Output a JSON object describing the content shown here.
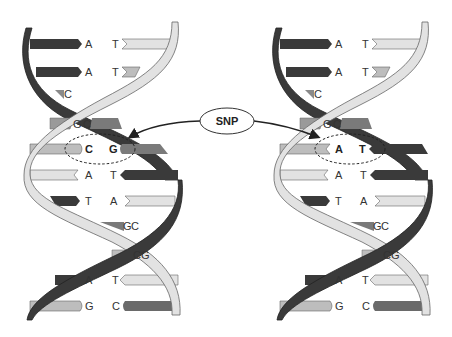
{
  "diagram": {
    "callout": {
      "label": "SNP"
    },
    "colors": {
      "dark_strand": "#3a3a3a",
      "light_strand": "#e2e2e2",
      "mid_gray": "#8a8a8a",
      "light_gray": "#bdbdbd",
      "stroke": "#555555"
    },
    "left_helix": {
      "pairs": [
        {
          "left": "A",
          "right": "T"
        },
        {
          "left": "A",
          "right": "T"
        },
        {
          "left": "C",
          "right": ""
        },
        {
          "left": "G",
          "right": "C"
        },
        {
          "left": "C",
          "right": "G",
          "highlight": true
        },
        {
          "left": "A",
          "right": "T"
        },
        {
          "left": "T",
          "right": "A"
        },
        {
          "left": "G",
          "right": "C"
        },
        {
          "left": "C",
          "right": "G"
        },
        {
          "left": "A",
          "right": "T"
        },
        {
          "left": "G",
          "right": "C"
        }
      ]
    },
    "right_helix": {
      "pairs": [
        {
          "left": "A",
          "right": "T"
        },
        {
          "left": "A",
          "right": "T"
        },
        {
          "left": "C",
          "right": ""
        },
        {
          "left": "G",
          "right": "C"
        },
        {
          "left": "A",
          "right": "T",
          "highlight": true
        },
        {
          "left": "A",
          "right": "T"
        },
        {
          "left": "T",
          "right": "A"
        },
        {
          "left": "G",
          "right": "C"
        },
        {
          "left": "C",
          "right": "G"
        },
        {
          "left": "A",
          "right": "T"
        },
        {
          "left": "G",
          "right": "C"
        }
      ]
    }
  }
}
